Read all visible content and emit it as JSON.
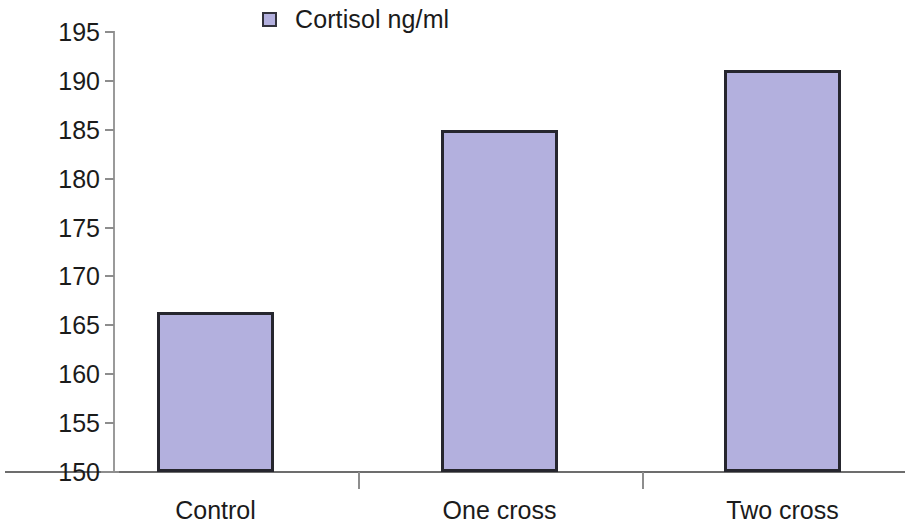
{
  "chart_data": {
    "type": "bar",
    "title": "",
    "xlabel": "",
    "ylabel": "",
    "categories": [
      "Control",
      "One cross",
      "Two cross"
    ],
    "series": [
      {
        "name": "Cortisol ng/ml",
        "values": [
          166.4,
          185,
          191.1
        ],
        "color": "#b3b0de"
      }
    ],
    "values": [
      166.4,
      185,
      191.1
    ],
    "ylim": [
      150,
      195
    ],
    "yticks": [
      150,
      155,
      160,
      165,
      170,
      175,
      180,
      185,
      190,
      195
    ],
    "ytick_labels": [
      "150",
      "155",
      "160",
      "165",
      "170",
      "175",
      "180",
      "185",
      "190",
      "195"
    ],
    "grid": false,
    "legend": {
      "position": "top-center",
      "entries": [
        {
          "label": "Cortisol ng/ml",
          "color": "#b3b0de"
        }
      ]
    },
    "colors": {
      "bar_fill": "#b3b0de",
      "bar_border": "#26262e",
      "axis": "#8d8d8d",
      "text": "#1b1b1b",
      "background": "#ffffff"
    }
  }
}
